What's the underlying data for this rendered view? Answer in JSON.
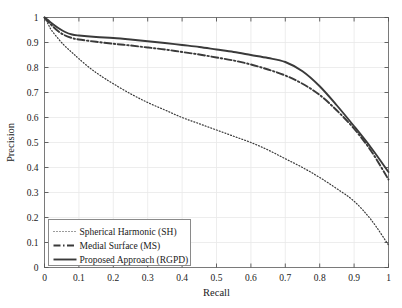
{
  "chart_data": {
    "type": "line",
    "title": "",
    "xlabel": "Recall",
    "ylabel": "Precision",
    "xlim": [
      0,
      1
    ],
    "ylim": [
      0,
      1
    ],
    "grid": true,
    "legend_position": "lower-left",
    "xticks": [
      "0",
      "0.1",
      "0.2",
      "0.3",
      "0.4",
      "0.5",
      "0.6",
      "0.7",
      "0.8",
      "0.9",
      "1"
    ],
    "yticks": [
      "0",
      "0.1",
      "0.2",
      "0.3",
      "0.4",
      "0.5",
      "0.6",
      "0.7",
      "0.8",
      "0.9",
      "1"
    ],
    "xtick_values": [
      0,
      0.1,
      0.2,
      0.3,
      0.4,
      0.5,
      0.6,
      0.7,
      0.8,
      0.9,
      1
    ],
    "ytick_values": [
      0,
      0.1,
      0.2,
      0.3,
      0.4,
      0.5,
      0.6,
      0.7,
      0.8,
      0.9,
      1
    ],
    "series": [
      {
        "name": "Spherical Harmonic (SH)",
        "style": "dotted",
        "color": "#3a3a3a",
        "x": [
          0,
          0.01,
          0.02,
          0.04,
          0.06,
          0.08,
          0.1,
          0.13,
          0.16,
          0.2,
          0.25,
          0.3,
          0.35,
          0.4,
          0.45,
          0.5,
          0.55,
          0.6,
          0.65,
          0.7,
          0.75,
          0.8,
          0.85,
          0.9,
          0.95,
          1
        ],
        "y": [
          1.0,
          0.975,
          0.95,
          0.915,
          0.885,
          0.86,
          0.835,
          0.8,
          0.77,
          0.735,
          0.695,
          0.66,
          0.63,
          0.6,
          0.575,
          0.55,
          0.525,
          0.5,
          0.47,
          0.435,
          0.4,
          0.36,
          0.315,
          0.265,
          0.19,
          0.09
        ]
      },
      {
        "name": "Medial Surface (MS)",
        "style": "dash-dot",
        "color": "#3a3a3a",
        "x": [
          0,
          0.01,
          0.02,
          0.04,
          0.06,
          0.08,
          0.1,
          0.15,
          0.2,
          0.25,
          0.3,
          0.35,
          0.4,
          0.45,
          0.5,
          0.55,
          0.6,
          0.65,
          0.7,
          0.75,
          0.8,
          0.85,
          0.9,
          0.95,
          1
        ],
        "y": [
          1.0,
          0.985,
          0.97,
          0.945,
          0.928,
          0.918,
          0.912,
          0.903,
          0.895,
          0.888,
          0.88,
          0.872,
          0.862,
          0.852,
          0.84,
          0.828,
          0.812,
          0.792,
          0.768,
          0.735,
          0.69,
          0.628,
          0.555,
          0.465,
          0.352
        ]
      },
      {
        "name": "Proposed Approach (RGPD)",
        "style": "solid",
        "color": "#3a3a3a",
        "x": [
          0,
          0.01,
          0.02,
          0.04,
          0.06,
          0.08,
          0.1,
          0.15,
          0.2,
          0.25,
          0.3,
          0.35,
          0.4,
          0.45,
          0.5,
          0.55,
          0.6,
          0.65,
          0.7,
          0.75,
          0.8,
          0.85,
          0.9,
          0.95,
          1
        ],
        "y": [
          1.0,
          0.99,
          0.978,
          0.958,
          0.942,
          0.932,
          0.928,
          0.922,
          0.918,
          0.912,
          0.905,
          0.898,
          0.89,
          0.882,
          0.872,
          0.862,
          0.85,
          0.838,
          0.822,
          0.785,
          0.725,
          0.648,
          0.565,
          0.478,
          0.382
        ]
      }
    ],
    "legend": [
      {
        "label": "Spherical Harmonic (SH)",
        "style": "dotted"
      },
      {
        "label": "Medial Surface (MS)",
        "style": "dash-dot"
      },
      {
        "label": "Proposed Approach (RGPD)",
        "style": "solid"
      }
    ]
  }
}
